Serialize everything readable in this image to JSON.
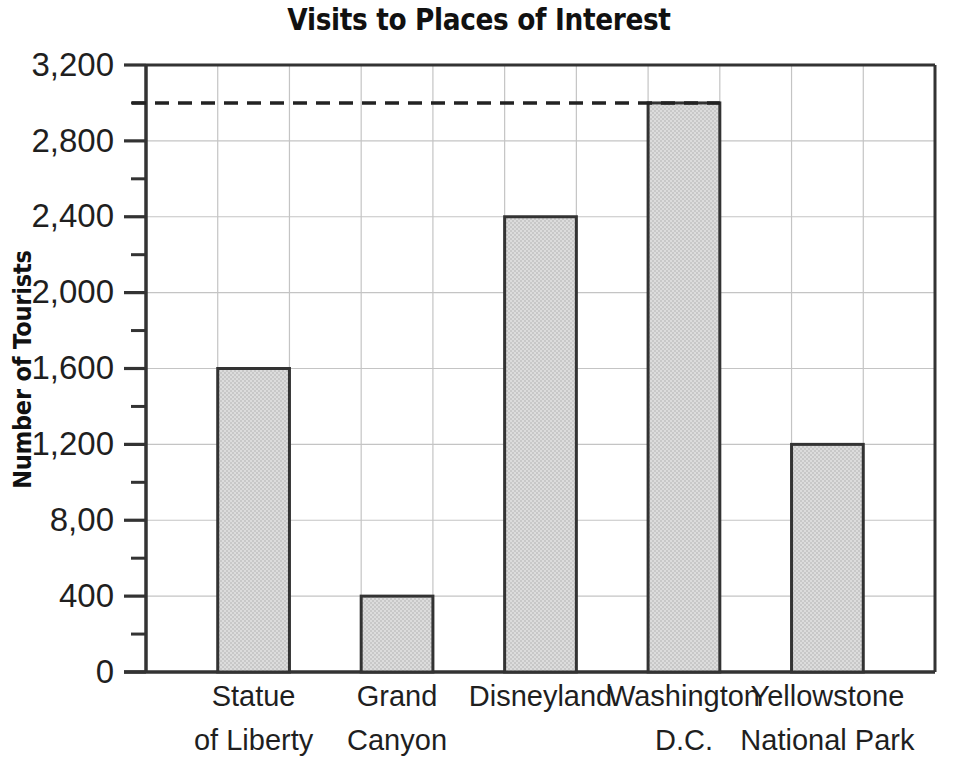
{
  "chart_data": {
    "type": "bar",
    "title": "Visits to Places of Interest",
    "xlabel": "",
    "ylabel": "Number of Tourists",
    "categories": [
      "Statue of Liberty",
      "Grand Canyon",
      "Disneyland",
      "Washington D.C.",
      "Yellowstone National Park"
    ],
    "category_lines": [
      [
        "Statue",
        "of Liberty"
      ],
      [
        "Grand",
        "Canyon"
      ],
      [
        "Disneyland",
        ""
      ],
      [
        "Washington",
        "D.C."
      ],
      [
        "Yellowstone",
        "National Park"
      ]
    ],
    "values": [
      1600,
      400,
      2400,
      3000,
      1200
    ],
    "ylim": [
      0,
      3200
    ],
    "y_major_step": 400,
    "y_minor_step": 200,
    "ytick_labels": [
      "3,200",
      "2,800",
      "2,400",
      "2,000",
      "1,600",
      "1,200",
      "8,00",
      "400",
      "0"
    ],
    "ytick_values": [
      3200,
      2800,
      2400,
      2000,
      1600,
      1200,
      800,
      400,
      0
    ],
    "grid": "both",
    "legend": "none",
    "annotations": [
      {
        "type": "dashed-reference-line",
        "value": 3000,
        "label": "",
        "from_category": "axis",
        "to_category": "Washington D.C."
      }
    ],
    "bar_style": {
      "fill": "#d2d2d2",
      "stroke": "#333333",
      "pattern": "halftone-dither"
    },
    "axis_color": "#333333",
    "grid_color": "#bfbfbf"
  },
  "colors": {
    "background": "#ffffff",
    "text": "#1a1a1a",
    "bar_fill": "#d2d2d2",
    "bar_stroke": "#333333",
    "grid": "#c4c4c4",
    "axis": "#333333",
    "dashed_line": "#222222"
  }
}
